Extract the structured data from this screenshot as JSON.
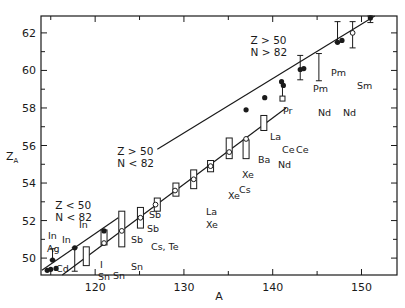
{
  "chart_data": {
    "type": "scatter",
    "title": "",
    "xlabel": "A",
    "ylabel": "Z_A",
    "xlim": [
      113.9,
      154
    ],
    "ylim": [
      49.1,
      62.9
    ],
    "x_ticks": [
      120,
      130,
      140,
      150
    ],
    "x_minor_ticks": [
      115,
      125,
      135,
      145
    ],
    "y_ticks": [
      50,
      52,
      54,
      56,
      58,
      60,
      62
    ],
    "grid": false,
    "legend": null,
    "regions": [
      {
        "label_z": "Z < 50",
        "label_n": "N < 82",
        "x": 115.5,
        "y": 52.6
      },
      {
        "label_z": "Z > 50",
        "label_n": "N < 82",
        "x": 122.5,
        "y": 55.5
      },
      {
        "label_z": "Z > 50",
        "label_n": "N > 82",
        "x": 137.5,
        "y": 61.4
      }
    ],
    "lines": [
      {
        "name": "Z<50, N<82 fit",
        "x": [
          114.0,
          122.6
        ],
        "y": [
          49.35,
          52.15
        ]
      },
      {
        "name": "Z>50, N<82 fit",
        "x": [
          116.3,
          141.5
        ],
        "y": [
          49.1,
          58.0
        ]
      },
      {
        "name": "Z>50, N>82 fit",
        "x": [
          127.0,
          151.5
        ],
        "y": [
          55.8,
          62.9
        ]
      }
    ],
    "series": [
      {
        "name": "filled points (direct measurements)",
        "marker": "filled-circle",
        "points": [
          {
            "x": 114.6,
            "y": 49.35,
            "label": ""
          },
          {
            "x": 115.0,
            "y": 49.4,
            "label": "Cd"
          },
          {
            "x": 115.6,
            "y": 49.45,
            "label": ""
          },
          {
            "x": 115.2,
            "y": 49.9,
            "label": "Ag",
            "err_hi": 50.5,
            "err_lo": 49.9
          },
          {
            "x": 117.7,
            "y": 50.55,
            "label": "In",
            "err_lo": 49.3
          },
          {
            "x": 121.0,
            "y": 51.45,
            "label": "In"
          },
          {
            "x": 137.0,
            "y": 57.9,
            "label": "Xe"
          },
          {
            "x": 139.1,
            "y": 58.55,
            "label": "Ba"
          },
          {
            "x": 141.0,
            "y": 59.4,
            "label": "La"
          },
          {
            "x": 141.2,
            "y": 59.2,
            "label": "Ce"
          },
          {
            "x": 143.1,
            "y": 60.05,
            "label": "Pr",
            "err_hi": 60.8,
            "err_lo": 59.5
          },
          {
            "x": 143.5,
            "y": 60.1,
            "label": "Ce"
          },
          {
            "x": 147.3,
            "y": 61.5,
            "label": "Nd",
            "err_hi": 62.6
          },
          {
            "x": 147.8,
            "y": 61.6,
            "label": "Pm"
          },
          {
            "x": 151.0,
            "y": 62.8,
            "label": "Sm",
            "err_hi": 62.9,
            "err_lo": 62.55
          }
        ]
      },
      {
        "name": "open points (indirect / estimates)",
        "marker": "open-circle",
        "points": [
          {
            "x": 121.0,
            "y": 50.8,
            "label": "I / Sn"
          },
          {
            "x": 123.0,
            "y": 51.45,
            "label": "Sn"
          },
          {
            "x": 125.1,
            "y": 52.15,
            "label": "Sb / Sn"
          },
          {
            "x": 126.8,
            "y": 52.85,
            "label": "Cs, Te"
          },
          {
            "x": 129.0,
            "y": 53.6,
            "label": ""
          },
          {
            "x": 131.1,
            "y": 54.2,
            "label": ""
          },
          {
            "x": 133.0,
            "y": 54.9,
            "label": "La / Xe"
          },
          {
            "x": 135.1,
            "y": 55.65,
            "label": "Xe"
          },
          {
            "x": 137.0,
            "y": 56.35,
            "label": "Cs"
          },
          {
            "x": 149.0,
            "y": 62.0,
            "label": "Nd",
            "err_hi": 62.6,
            "err_lo": 61.2
          }
        ]
      },
      {
        "name": "range bars (rectangles)",
        "marker": "rectangle",
        "points": [
          {
            "x": 119.0,
            "y_lo": 49.6,
            "y_hi": 50.6
          },
          {
            "x": 121.0,
            "y_lo": 50.7,
            "y_hi": 51.5
          },
          {
            "x": 123.0,
            "y_lo": 50.6,
            "y_hi": 52.5
          },
          {
            "x": 125.1,
            "y_lo": 51.6,
            "y_hi": 52.7
          },
          {
            "x": 127.0,
            "y_lo": 52.5,
            "y_hi": 53.2
          },
          {
            "x": 129.1,
            "y_lo": 53.3,
            "y_hi": 54.0
          },
          {
            "x": 131.1,
            "y_lo": 53.7,
            "y_hi": 54.7
          },
          {
            "x": 133.0,
            "y_lo": 54.6,
            "y_hi": 55.2
          },
          {
            "x": 135.1,
            "y_lo": 55.3,
            "y_hi": 56.4
          },
          {
            "x": 137.0,
            "y_lo": 55.3,
            "y_hi": 56.3
          },
          {
            "x": 139.0,
            "y_lo": 56.8,
            "y_hi": 57.6
          }
        ]
      },
      {
        "name": "open squares",
        "marker": "open-square",
        "points": [
          {
            "x": 141.1,
            "y": 58.5,
            "label": "Nd"
          }
        ]
      }
    ],
    "error_bars_only": [
      {
        "x": 145.2,
        "y_lo": 59.45,
        "y_hi": 60.9
      }
    ]
  },
  "labels": {
    "x_axis_title": "A",
    "y_axis_title": "Z",
    "y_axis_sub": "A"
  }
}
